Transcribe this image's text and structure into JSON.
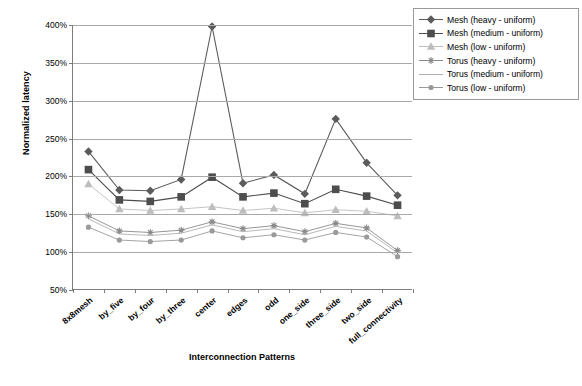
{
  "chart_data": {
    "type": "line",
    "title": "",
    "xlabel": "Interconnection Patterns",
    "ylabel": "Normalized latency",
    "categories": [
      "8x8mesh",
      "by_five",
      "by_four",
      "by_three",
      "center",
      "edges",
      "odd",
      "one_side",
      "three_side",
      "two_side",
      "full_connectivity"
    ],
    "ylim": [
      50,
      400
    ],
    "ytick_labels": [
      "50%",
      "100%",
      "150%",
      "200%",
      "250%",
      "300%",
      "350%",
      "400%"
    ],
    "ytick_values": [
      50,
      100,
      150,
      200,
      250,
      300,
      350,
      400
    ],
    "yunit": "%",
    "grid": true,
    "legend_position": "top-right",
    "series": [
      {
        "name": "Mesh (heavy - uniform)",
        "marker": "diamond",
        "color": "#5b5b5b",
        "values": [
          233,
          182,
          181,
          196,
          398,
          191,
          202,
          177,
          276,
          218,
          175
        ]
      },
      {
        "name": "Mesh (medium - uniform)",
        "marker": "square",
        "color": "#4d4d4d",
        "values": [
          209,
          169,
          167,
          173,
          199,
          173,
          178,
          164,
          183,
          174,
          162
        ]
      },
      {
        "name": "Mesh (low - uniform)",
        "marker": "triangle",
        "color": "#bdbdbd",
        "values": [
          190,
          157,
          155,
          157,
          160,
          155,
          158,
          152,
          156,
          154,
          148
        ]
      },
      {
        "name": "Torus (heavy - uniform)",
        "marker": "star",
        "color": "#8a8a8a",
        "values": [
          148,
          128,
          126,
          129,
          140,
          131,
          135,
          127,
          138,
          132,
          102
        ]
      },
      {
        "name": "Torus (medium - uniform)",
        "marker": "line",
        "color": "#b0b0b0",
        "values": [
          144,
          124,
          122,
          125,
          136,
          127,
          131,
          123,
          134,
          128,
          99
        ]
      },
      {
        "name": "Torus (low - uniform)",
        "marker": "circle",
        "color": "#9a9a9a",
        "values": [
          133,
          116,
          114,
          116,
          128,
          119,
          123,
          116,
          126,
          120,
          94
        ]
      }
    ]
  }
}
